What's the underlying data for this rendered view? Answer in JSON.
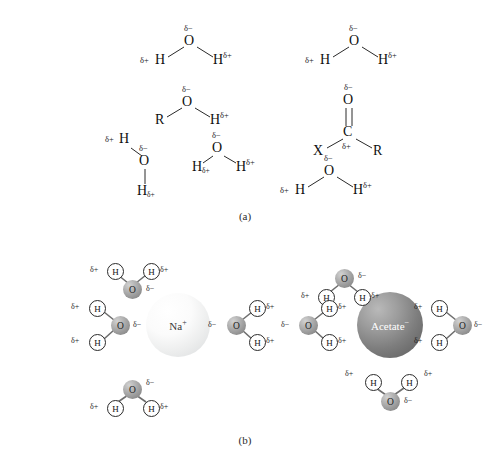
{
  "figure": {
    "panels": [
      {
        "id": "a",
        "label": "(a)",
        "caption_x": 225,
        "caption_y": 210
      },
      {
        "id": "b",
        "label": "(b)",
        "caption_x": 225,
        "caption_y": 434
      }
    ]
  },
  "symbols": {
    "delta_minus": "δ−",
    "delta_plus": "δ+",
    "oxygen": "O",
    "hydrogen": "H",
    "carbon": "C",
    "r_group": "R",
    "x_group": "X"
  },
  "panel_a": {
    "description": "Hydrogen-bond donor and acceptor groups with partial charges",
    "molecules": [
      {
        "name": "water-top-left",
        "type": "water",
        "atoms": [
          {
            "label": "O",
            "x": 190,
            "y": 42,
            "charge": "δ−",
            "charge_pos": "above"
          },
          {
            "label": "H",
            "x": 160,
            "y": 62,
            "charge": "δ+",
            "charge_pos": "left"
          },
          {
            "label": "H",
            "x": 220,
            "y": 62,
            "charge": "δ+",
            "charge_pos": "right"
          }
        ]
      },
      {
        "name": "water-top-right",
        "type": "water",
        "atoms": [
          {
            "label": "O",
            "x": 355,
            "y": 42,
            "charge": "δ−",
            "charge_pos": "above"
          },
          {
            "label": "H",
            "x": 325,
            "y": 62,
            "charge": "δ+",
            "charge_pos": "left"
          },
          {
            "label": "H",
            "x": 385,
            "y": 62,
            "charge": "δ+",
            "charge_pos": "right"
          }
        ]
      },
      {
        "name": "alcohol-hydroxyl",
        "type": "alcohol",
        "atoms": [
          {
            "label": "O",
            "x": 188,
            "y": 103,
            "charge": "δ−",
            "charge_pos": "above"
          },
          {
            "label": "R",
            "x": 160,
            "y": 122,
            "charge": "",
            "charge_pos": "none"
          },
          {
            "label": "H",
            "x": 216,
            "y": 122,
            "charge": "δ+",
            "charge_pos": "right"
          }
        ]
      },
      {
        "name": "carbonyl-group",
        "type": "carbonyl",
        "atoms": [
          {
            "label": "O",
            "x": 349,
            "y": 101,
            "charge": "δ−",
            "charge_pos": "above"
          },
          {
            "label": "C",
            "x": 349,
            "y": 133,
            "charge": "δ+",
            "charge_pos": "below"
          },
          {
            "label": "X",
            "x": 320,
            "y": 153,
            "charge": "",
            "charge_pos": "none"
          },
          {
            "label": "R",
            "x": 379,
            "y": 153,
            "charge": "",
            "charge_pos": "none"
          }
        ]
      },
      {
        "name": "water-lower-left",
        "type": "water",
        "atoms": [
          {
            "label": "O",
            "x": 145,
            "y": 162,
            "charge": "δ−",
            "charge_pos": "above"
          },
          {
            "label": "H",
            "x": 125,
            "y": 143,
            "charge": "δ+",
            "charge_pos": "left"
          },
          {
            "label": "H",
            "x": 145,
            "y": 192,
            "charge": "δ+",
            "charge_pos": "sub"
          }
        ]
      },
      {
        "name": "water-lower-middle",
        "type": "water",
        "atoms": [
          {
            "label": "O",
            "x": 218,
            "y": 150,
            "charge": "δ−",
            "charge_pos": "above"
          },
          {
            "label": "H",
            "x": 196,
            "y": 168,
            "charge": "δ+",
            "charge_pos": "sub-left"
          },
          {
            "label": "H",
            "x": 243,
            "y": 168,
            "charge": "δ+",
            "charge_pos": "right"
          }
        ]
      },
      {
        "name": "water-lower-right",
        "type": "water",
        "atoms": [
          {
            "label": "O",
            "x": 330,
            "y": 172,
            "charge": "δ−",
            "charge_pos": "above"
          },
          {
            "label": "H",
            "x": 300,
            "y": 192,
            "charge": "δ+",
            "charge_pos": "left"
          },
          {
            "label": "H",
            "x": 360,
            "y": 192,
            "charge": "δ+",
            "charge_pos": "right"
          }
        ]
      }
    ]
  },
  "panel_b": {
    "description": "Hydration shells around a cation and an anion",
    "clusters": [
      {
        "name": "sodium-hydration-shell",
        "ion": {
          "name": "sodium-ion",
          "label": "Na",
          "charge": "+",
          "cx": 178,
          "cy": 325,
          "r": 32,
          "fill": "#f2f3f3",
          "text_color": "#3a3a3a",
          "style": "light"
        },
        "waters": [
          {
            "position": "top",
            "orientation": "oxygen-toward-ion"
          },
          {
            "position": "left",
            "orientation": "oxygen-toward-ion"
          },
          {
            "position": "right",
            "orientation": "oxygen-toward-ion"
          },
          {
            "position": "bottom",
            "orientation": "oxygen-toward-ion"
          }
        ]
      },
      {
        "name": "acetate-hydration-shell",
        "ion": {
          "name": "acetate-ion",
          "label": "Acetate",
          "charge": "−",
          "cx": 390,
          "cy": 325,
          "r": 33,
          "fill": "#7d7d7d",
          "text_color": "#ffffff",
          "style": "dark"
        },
        "waters": [
          {
            "position": "top",
            "orientation": "hydrogen-toward-ion"
          },
          {
            "position": "left",
            "orientation": "hydrogen-toward-ion"
          },
          {
            "position": "right",
            "orientation": "hydrogen-toward-ion"
          },
          {
            "position": "bottom",
            "orientation": "hydrogen-toward-ion"
          }
        ]
      }
    ],
    "atom_labels": {
      "oxygen": "O",
      "hydrogen": "H"
    },
    "charge_labels": {
      "oxygen": "δ−",
      "hydrogen": "δ+"
    }
  }
}
